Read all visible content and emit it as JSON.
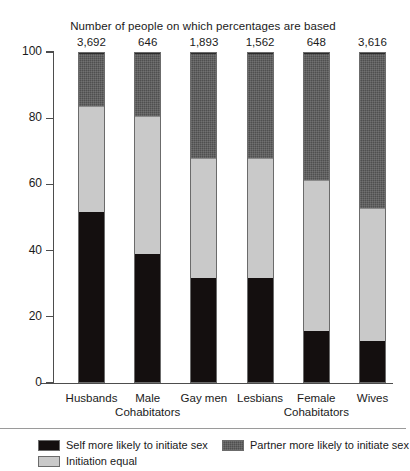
{
  "chart_data": {
    "type": "bar",
    "stacked": true,
    "title": "Number of people on which percentages are based",
    "xlabel": "",
    "ylabel": "",
    "ylim": [
      0,
      100
    ],
    "yticks": [
      0,
      20,
      40,
      60,
      80,
      100
    ],
    "ytick_labels": [
      "0",
      "20",
      "40",
      "60",
      "80",
      "100"
    ],
    "grid": false,
    "legend_position": "bottom",
    "categories": [
      "Husbands",
      "Male Cohabitators",
      "Gay men",
      "Lesbians",
      "Female Cohabitators",
      "Wives"
    ],
    "category_lines": [
      [
        "Husbands",
        ""
      ],
      [
        "Male",
        "Cohabitators"
      ],
      [
        "Gay men",
        ""
      ],
      [
        "Lesbians",
        ""
      ],
      [
        "Female",
        "Cohabitators"
      ],
      [
        "Wives",
        ""
      ]
    ],
    "sample_sizes": [
      "3,692",
      "646",
      "1,893",
      "1,562",
      "648",
      "3,616"
    ],
    "series": [
      {
        "name": "Self more likely to initiate sex",
        "color": "#140f0f",
        "values": [
          51.6,
          39.0,
          31.7,
          31.6,
          15.4,
          12.4
        ]
      },
      {
        "name": "Initiation equal",
        "color": "#c9c9c9",
        "values": [
          32.4,
          42.0,
          36.3,
          36.4,
          46.1,
          40.4
        ]
      },
      {
        "name": "Partner more likely to initiate sex",
        "color": "#4f4f4f",
        "values": [
          16.0,
          19.0,
          32.0,
          32.0,
          38.5,
          47.2
        ]
      }
    ]
  },
  "legend": {
    "self": "Self more likely to initiate sex",
    "partner": "Partner more likely to initiate sex",
    "equal": "Initiation equal"
  }
}
